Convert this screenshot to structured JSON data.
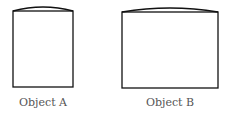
{
  "objects": [
    {
      "label": "Object A",
      "x": 13,
      "y": 11,
      "width": 60,
      "height": 76,
      "arc_peak_y": 7
    },
    {
      "label": "Object B",
      "x": 122,
      "y": 12,
      "width": 96,
      "height": 76,
      "arc_peak_y": 8
    }
  ],
  "colors": {
    "stroke": "#111111",
    "label": "#555555"
  }
}
